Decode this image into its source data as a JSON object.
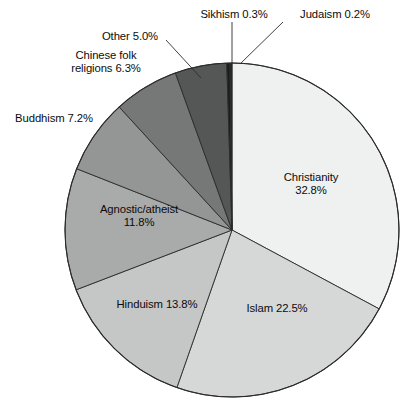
{
  "chart_data": {
    "type": "pie",
    "title": "",
    "subtitle": "",
    "xlabel": "",
    "ylabel": "",
    "legend_position": "none",
    "grid": false,
    "units": "percent",
    "start_angle_deg": 0,
    "direction": "clockwise",
    "categories": [
      "Christianity",
      "Islam",
      "Hinduism",
      "Agnostic/atheist",
      "Buddhism",
      "Chinese folk religions",
      "Other",
      "Sikhism",
      "Judaism"
    ],
    "values": [
      32.8,
      22.5,
      13.8,
      11.8,
      7.2,
      6.3,
      5.0,
      0.3,
      0.2
    ],
    "slices": [
      {
        "name": "Christianity",
        "value": 32.8,
        "label": "Christianity",
        "value_label": "32.8%",
        "color": "#eff0f0",
        "label_placement": "inside"
      },
      {
        "name": "Islam",
        "value": 22.5,
        "label": "Islam 22.5%",
        "value_label": "22.5%",
        "color": "#d6d7d7",
        "label_placement": "inside"
      },
      {
        "name": "Hinduism",
        "value": 13.8,
        "label": "Hinduism 13.8%",
        "value_label": "13.8%",
        "color": "#c5c6c6",
        "label_placement": "inside"
      },
      {
        "name": "Agnostic/atheist",
        "value": 11.8,
        "label": "Agnostic/atheist",
        "value_label": "11.8%",
        "color": "#a9aaaa",
        "label_placement": "inside"
      },
      {
        "name": "Buddhism",
        "value": 7.2,
        "label": "Buddhism 7.2%",
        "value_label": "7.2%",
        "color": "#949595",
        "label_placement": "outside"
      },
      {
        "name": "Chinese folk religions",
        "value": 6.3,
        "label": "Chinese folk religions 6.3%",
        "value_label": "6.3%",
        "color": "#767777",
        "label_placement": "outside"
      },
      {
        "name": "Other",
        "value": 5.0,
        "label": "Other 5.0%",
        "value_label": "5.0%",
        "color": "#555656",
        "label_placement": "outside"
      },
      {
        "name": "Sikhism",
        "value": 0.3,
        "label": "Sikhism 0.3%",
        "value_label": "0.3%",
        "color": "#1c1c1c",
        "label_placement": "outside-callout"
      },
      {
        "name": "Judaism",
        "value": 0.2,
        "label": "Judaism 0.2%",
        "value_label": "0.2%",
        "color": "#262626",
        "label_placement": "outside-callout"
      }
    ]
  },
  "labels": {
    "sikhism": "Sikhism 0.3%",
    "judaism": "Judaism 0.2%",
    "other": "Other 5.0%",
    "chinese_line1": "Chinese folk",
    "chinese_line2": "religions 6.3%",
    "buddhism": "Buddhism 7.2%",
    "christianity_line1": "Christianity",
    "christianity_line2": "32.8%",
    "islam": "Islam 22.5%",
    "hinduism": "Hinduism 13.8%",
    "agnostic_line1": "Agnostic/atheist",
    "agnostic_line2": "11.8%"
  },
  "style": {
    "background": "#ffffff",
    "outline": "#2b2b2b",
    "text": "#0c0c0c",
    "leader_line": "#2b2b2b"
  }
}
